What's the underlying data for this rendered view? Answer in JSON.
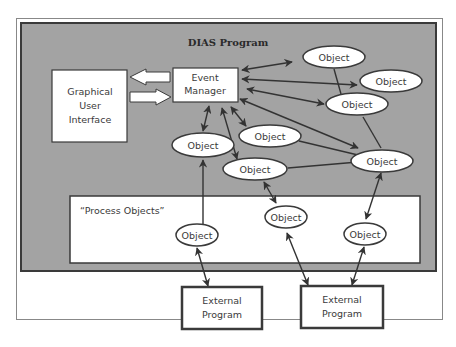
{
  "diagram": {
    "title": "DIAS Program",
    "colors": {
      "program_bg": "#a3a3a3",
      "border": "#3a3a3a",
      "node_fill": "#ffffff",
      "arrow": "#333333"
    },
    "gui": {
      "lines": [
        "Graphical",
        "User",
        "Interface"
      ]
    },
    "event_manager": {
      "lines": [
        "Event",
        "Manager"
      ]
    },
    "process_objects_label": "“Process Objects”",
    "objects": [
      {
        "id": "obj-top",
        "label": "Object"
      },
      {
        "id": "obj-right-upper",
        "label": "Object"
      },
      {
        "id": "obj-right-mid",
        "label": "Object"
      },
      {
        "id": "obj-center",
        "label": "Object"
      },
      {
        "id": "obj-left",
        "label": "Object"
      },
      {
        "id": "obj-center-low",
        "label": "Object"
      },
      {
        "id": "obj-right-low",
        "label": "Object"
      },
      {
        "id": "proc-obj-1",
        "label": "Object"
      },
      {
        "id": "proc-obj-2",
        "label": "Object"
      },
      {
        "id": "proc-obj-3",
        "label": "Object"
      }
    ],
    "external_programs": [
      {
        "lines": [
          "External",
          "Program"
        ]
      },
      {
        "lines": [
          "External",
          "Program"
        ]
      }
    ]
  }
}
